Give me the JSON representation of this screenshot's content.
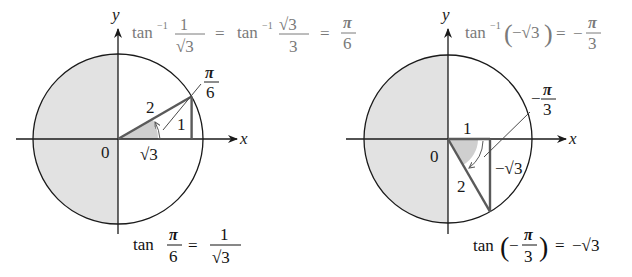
{
  "colors": {
    "background": "#ffffff",
    "axis": "#1a1a1a",
    "circle": "#1a1a1a",
    "shade": "#e2e2e2",
    "wedge": "#c8c8c8",
    "triangle": "#5a5a5a",
    "leader": "#4a4a4a",
    "caption_top": "#7a7a7a",
    "caption_bottom": "#111111"
  },
  "left": {
    "axis_x_label": "x",
    "axis_y_label": "y",
    "origin_label": "0",
    "hypotenuse_label": "2",
    "opposite_label": "1",
    "adjacent_label": "√3",
    "angle_label_num": "π",
    "angle_label_den": "6",
    "top_formula": {
      "tan_inv": "tan",
      "exp": "−1",
      "frac1_num": "1",
      "frac1_den": "√3",
      "eq": "=",
      "tan_inv2": "tan",
      "exp2": "−1",
      "frac2_num": "√3",
      "frac2_den": "3",
      "eq2": "=",
      "result_num": "π",
      "result_den": "6"
    },
    "bottom_formula": {
      "tan": "tan",
      "arg_num": "π",
      "arg_den": "6",
      "eq": "=",
      "val_num": "1",
      "val_den": "√3"
    }
  },
  "right": {
    "axis_x_label": "x",
    "axis_y_label": "y",
    "origin_label": "0",
    "hypotenuse_label": "2",
    "adjacent_label": "1",
    "opposite_label": "−√3",
    "angle_label_sign": "−",
    "angle_label_num": "π",
    "angle_label_den": "3",
    "top_formula": {
      "tan_inv": "tan",
      "exp": "−1",
      "lparen": "(",
      "arg": "−√3",
      "rparen": ")",
      "eq": "=",
      "sign": "−",
      "result_num": "π",
      "result_den": "3"
    },
    "bottom_formula": {
      "tan": "tan",
      "lparen": "(",
      "sign": "−",
      "arg_num": "π",
      "arg_den": "3",
      "rparen": ")",
      "eq": "=",
      "value": "−√3"
    }
  }
}
